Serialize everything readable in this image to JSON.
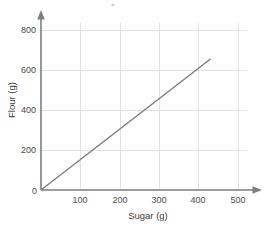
{
  "chart_data": {
    "type": "line",
    "title": "",
    "xlabel": "Sugar (g)",
    "ylabel": "Flour (g)",
    "xlim": [
      0,
      520
    ],
    "ylim": [
      0,
      860
    ],
    "xticks": [
      100,
      200,
      300,
      400,
      500
    ],
    "yticks": [
      200,
      400,
      600,
      800
    ],
    "origin_label": "0",
    "grid": true,
    "legend": "none",
    "series": [
      {
        "name": "Flour vs Sugar",
        "color": "#7a7a80",
        "x": [
          0,
          430
        ],
        "y": [
          0,
          655
        ],
        "slope": 1.52,
        "points": [
          {
            "x": 0,
            "y": 0
          },
          {
            "x": 100,
            "y": 152
          },
          {
            "x": 200,
            "y": 305
          },
          {
            "x": 300,
            "y": 457
          },
          {
            "x": 400,
            "y": 610
          },
          {
            "x": 430,
            "y": 655
          }
        ]
      }
    ]
  },
  "axes": {
    "x_tick_labels": [
      "100",
      "200",
      "300",
      "400",
      "500"
    ],
    "y_tick_labels": [
      "200",
      "400",
      "600",
      "800"
    ],
    "origin": "0",
    "x_title": "Sugar (g)",
    "y_title": "Flour (g)"
  },
  "colors": {
    "line": "#7a7a80",
    "grid": "#e2e2e6",
    "axis": "#7d7d82",
    "text": "#4a4a4a",
    "background": "#ffffff"
  }
}
